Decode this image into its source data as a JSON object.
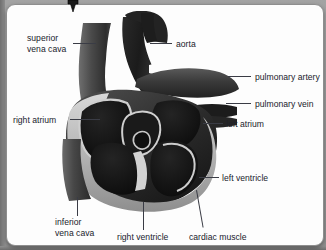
{
  "figure": {
    "style": "grayscale illustration",
    "background_color": "#9a9a9a",
    "card_color": "#fdfdfd",
    "text_color": "#20222c",
    "leader_color": "#3a3c45"
  },
  "cursor": {
    "icon": "down-arrow-cursor",
    "x": 72,
    "y": 5
  },
  "labels": [
    {
      "id": "superior-vena-cava",
      "line1": "superior",
      "line2": "vena cava",
      "text": "superior vena cava",
      "x": 20,
      "y": 28,
      "align": "left"
    },
    {
      "id": "aorta",
      "text": "aorta",
      "x": 169,
      "y": 34,
      "align": "left"
    },
    {
      "id": "pulmonary-artery",
      "text": "pulmonary artery",
      "x": 248,
      "y": 67,
      "align": "left"
    },
    {
      "id": "pulmonary-vein",
      "text": "pulmonary vein",
      "x": 248,
      "y": 94,
      "align": "left"
    },
    {
      "id": "right-atrium",
      "text": "right atrium",
      "x": 6,
      "y": 110,
      "align": "left"
    },
    {
      "id": "left-atrium",
      "text": "left atrium",
      "x": 219,
      "y": 114,
      "align": "left"
    },
    {
      "id": "left-ventricle",
      "text": "left ventricle",
      "x": 215,
      "y": 168,
      "align": "left"
    },
    {
      "id": "inferior-vena-cava",
      "line1": "inferior",
      "line2": "vena cava",
      "text": "inferior vena cava",
      "x": 48,
      "y": 212,
      "align": "left"
    },
    {
      "id": "right-ventricle",
      "text": "right ventricle",
      "x": 110,
      "y": 227,
      "align": "left"
    },
    {
      "id": "cardiac-muscle",
      "text": "cardiac muscle",
      "x": 182,
      "y": 227,
      "align": "left"
    }
  ]
}
